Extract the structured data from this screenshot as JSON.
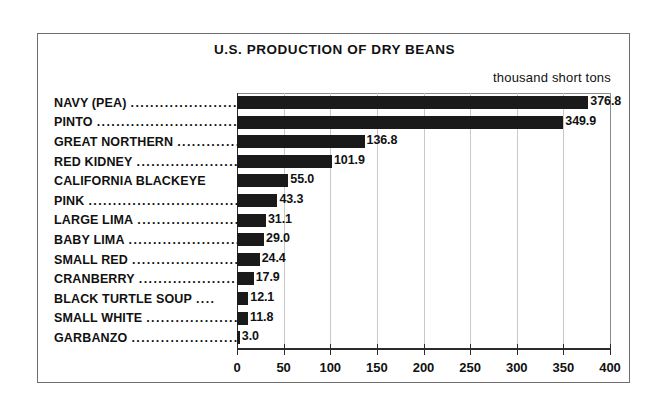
{
  "chart_data": {
    "type": "bar",
    "orientation": "horizontal",
    "title": "U.S. PRODUCTION OF DRY BEANS",
    "units_caption": "thousand short tons",
    "xlabel": "",
    "ylabel": "",
    "xlim": [
      0,
      400
    ],
    "xticks": [
      0,
      50,
      100,
      150,
      200,
      250,
      300,
      350,
      400
    ],
    "xtick_labels": [
      "0",
      "50",
      "100",
      "150",
      "200",
      "250",
      "300",
      "350",
      "400"
    ],
    "grid": "vertical",
    "legend": "none",
    "bar_color": "#1a1a1a",
    "categories": [
      "NAVY (PEA)",
      "PINTO",
      "GREAT NORTHERN",
      "RED KIDNEY",
      "CALIFORNIA BLACKEYE",
      "PINK",
      "LARGE LIMA",
      "BABY LIMA",
      "SMALL RED",
      "CRANBERRY",
      "BLACK TURTLE SOUP",
      "SMALL WHITE",
      "GARBANZO"
    ],
    "values": [
      376.8,
      349.9,
      136.8,
      101.9,
      55.0,
      43.3,
      31.1,
      29.0,
      24.4,
      17.9,
      12.1,
      11.8,
      3.0
    ],
    "value_labels": [
      "376.8",
      "349.9",
      "136.8",
      "101.9",
      "55.0",
      "43.3",
      "31.1",
      "29.0",
      "24.4",
      "17.9",
      "12.1",
      "11.8",
      "3.0"
    ],
    "leaders": [
      "..........................",
      "..............................",
      "....................",
      "............................",
      "",
      "................................",
      "..........................",
      "............................",
      "............................",
      "..........................",
      "....",
      "....................",
      "..........................."
    ]
  }
}
